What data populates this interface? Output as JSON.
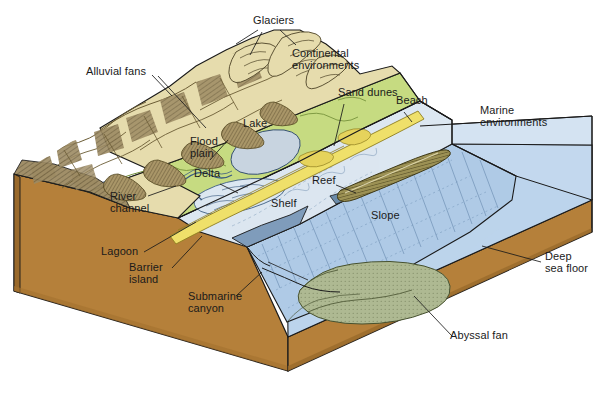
{
  "figure": {
    "type": "block-diagram",
    "background_color": "#ffffff"
  },
  "palette": {
    "mountain_tan": "#E6DCAD",
    "mountain_shadow": "#9C8A62",
    "lowland_green": "#C6DB81",
    "beach_sand_yellow": "#EFE06A",
    "shelf_pale_blue": "#DCE7F1",
    "sea_blue": "#AFCBE6",
    "deep_sea_blue": "#BCD4EC",
    "earth_brown": "#B5803A",
    "earth_brown_dark": "#9A6A2C",
    "abyssal_fan_olive": "#AEB992",
    "reef_olive": "#9C9154",
    "lake_grey_blue": "#C8D4E0",
    "outline": "#1a1a1a",
    "label_text": "#1a1a1a"
  },
  "labels": [
    {
      "id": "glaciers",
      "text": "Glaciers",
      "x": 253,
      "y": 20,
      "align": "left"
    },
    {
      "id": "alluvial-fans",
      "text": "Alluvial fans",
      "x": 86,
      "y": 71,
      "align": "left"
    },
    {
      "id": "continental-environments",
      "text": "Continental\nenvironments",
      "x": 295,
      "y": 53,
      "align": "left"
    },
    {
      "id": "sand-dunes",
      "text": "Sand dunes",
      "x": 340,
      "y": 92,
      "align": "left"
    },
    {
      "id": "beach",
      "text": "Beach",
      "x": 397,
      "y": 100,
      "align": "left"
    },
    {
      "id": "marine-environments",
      "text": "Marine\nenvironments",
      "x": 482,
      "y": 110,
      "align": "left"
    },
    {
      "id": "lake",
      "text": "Lake",
      "x": 243,
      "y": 123,
      "align": "left"
    },
    {
      "id": "flood-plain",
      "text": "Flood\nplain",
      "x": 192,
      "y": 141,
      "align": "left"
    },
    {
      "id": "delta",
      "text": "Delta",
      "x": 196,
      "y": 173,
      "align": "left"
    },
    {
      "id": "reef",
      "text": "Reef",
      "x": 314,
      "y": 180,
      "align": "left"
    },
    {
      "id": "river-channel",
      "text": "River\nchannel",
      "x": 113,
      "y": 196,
      "align": "left"
    },
    {
      "id": "shelf",
      "text": "Shelf",
      "x": 273,
      "y": 203,
      "align": "left"
    },
    {
      "id": "slope",
      "text": "Slope",
      "x": 373,
      "y": 215,
      "align": "left"
    },
    {
      "id": "lagoon",
      "text": "Lagoon",
      "x": 103,
      "y": 251,
      "align": "left"
    },
    {
      "id": "barrier-island",
      "text": "Barrier\nisland",
      "x": 131,
      "y": 267,
      "align": "left"
    },
    {
      "id": "deep-sea-floor",
      "text": "Deep\nsea floor",
      "x": 541,
      "y": 256,
      "align": "left"
    },
    {
      "id": "submarine-canyon",
      "text": "Submarine\ncanyon",
      "x": 190,
      "y": 296,
      "align": "left"
    },
    {
      "id": "abyssal-fan",
      "text": "Abyssal fan",
      "x": 450,
      "y": 335,
      "align": "left"
    }
  ],
  "regions": [
    {
      "id": "mountains",
      "name": "Mountain range with glaciers",
      "color_key": "mountain_tan"
    },
    {
      "id": "alluvial-fans",
      "name": "Alluvial fans",
      "color_key": "mountain_shadow"
    },
    {
      "id": "flood-plain",
      "name": "Flood plain / lowland",
      "color_key": "lowland_green"
    },
    {
      "id": "lake",
      "name": "Lake",
      "color_key": "lake_grey_blue"
    },
    {
      "id": "beach",
      "name": "Beach and sand dunes",
      "color_key": "beach_sand_yellow"
    },
    {
      "id": "shelf",
      "name": "Continental shelf",
      "color_key": "shelf_pale_blue"
    },
    {
      "id": "slope",
      "name": "Continental slope",
      "color_key": "sea_blue"
    },
    {
      "id": "deep-sea",
      "name": "Deep sea floor",
      "color_key": "deep_sea_blue"
    },
    {
      "id": "abyssal-fan",
      "name": "Abyssal fan",
      "color_key": "abyssal_fan_olive"
    },
    {
      "id": "reef",
      "name": "Reef",
      "color_key": "reef_olive"
    },
    {
      "id": "crust",
      "name": "Crustal block side / front face",
      "color_key": "earth_brown"
    }
  ],
  "leader_lines": [
    {
      "from": "glaciers",
      "to": "glacier-valley"
    },
    {
      "from": "alluvial-fans",
      "to": "fan-apex"
    },
    {
      "from": "sand-dunes",
      "to": "dune-field"
    },
    {
      "from": "beach",
      "to": "shoreline"
    },
    {
      "from": "flood-plain",
      "to": "plain-surface"
    },
    {
      "from": "delta",
      "to": "delta-lobe"
    },
    {
      "from": "river-channel",
      "to": "meander"
    },
    {
      "from": "reef",
      "to": "reef-body"
    },
    {
      "from": "lagoon",
      "to": "lagoon-water"
    },
    {
      "from": "barrier-island",
      "to": "barrier-bar"
    },
    {
      "from": "submarine-canyon",
      "to": "canyon-head"
    },
    {
      "from": "deep-sea-floor",
      "to": "abyssal-plain"
    },
    {
      "from": "abyssal-fan",
      "to": "fan-body"
    }
  ]
}
